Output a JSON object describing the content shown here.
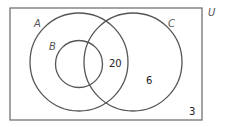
{
  "diagram": {
    "type": "venn",
    "universe": {
      "label": "U",
      "outside_value": "3"
    },
    "sets": [
      {
        "id": "A",
        "label": "A"
      },
      {
        "id": "B",
        "label": "B",
        "subset_of": "A"
      },
      {
        "id": "C",
        "label": "C"
      }
    ],
    "regions": [
      {
        "region": "A∩C (outside B)",
        "value": "20"
      },
      {
        "region": "C only",
        "value": "6"
      },
      {
        "region": "outside A∪C",
        "value": "3"
      }
    ],
    "colors": {
      "stroke": "#555555",
      "text": "#222222",
      "background": "#ffffff"
    }
  }
}
